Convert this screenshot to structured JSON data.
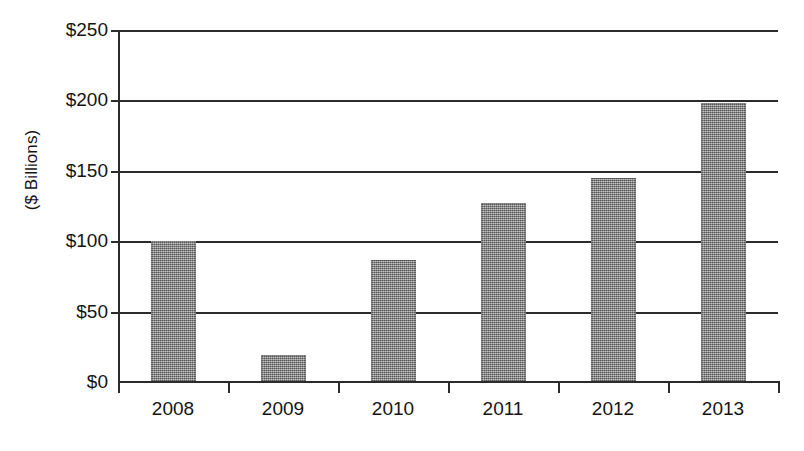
{
  "chart_data": {
    "type": "bar",
    "title": "",
    "subtitle": "",
    "xlabel": "",
    "ylabel": "($ Billions)",
    "categories": [
      "2008",
      "2009",
      "2010",
      "2011",
      "2012",
      "2013"
    ],
    "values": [
      100,
      19,
      87,
      127,
      145,
      198
    ],
    "series": [
      {
        "name": "",
        "values": [
          100,
          19,
          87,
          127,
          145,
          198
        ]
      }
    ],
    "ylim": [
      0,
      250
    ],
    "ytick_labels": [
      "$0",
      "$50",
      "$100",
      "$150",
      "$200",
      "$250"
    ],
    "ytick_values": [
      0,
      50,
      100,
      150,
      200,
      250
    ],
    "ytick_step": 50,
    "grid": true,
    "grid_axis": "y",
    "legend": false,
    "legend_position": "none",
    "annotations": [],
    "bar_color": "#8a8a8a",
    "axis_color": "#2b2b2b",
    "background_color": "#ffffff"
  },
  "axis": {
    "y_title": "($ Billions)",
    "ticks": [
      {
        "label": "$250",
        "value": 250
      },
      {
        "label": "$200",
        "value": 200
      },
      {
        "label": "$150",
        "value": 150
      },
      {
        "label": "$100",
        "value": 100
      },
      {
        "label": "$50",
        "value": 50
      },
      {
        "label": "$0",
        "value": 0
      }
    ]
  },
  "x_axis": {
    "labels": [
      "2008",
      "2009",
      "2010",
      "2011",
      "2012",
      "2013"
    ]
  },
  "caption": {
    "text": ""
  }
}
